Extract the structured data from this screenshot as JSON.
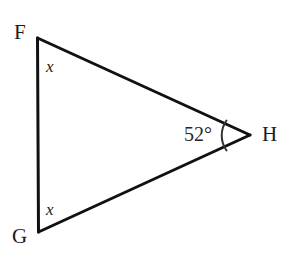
{
  "figure": {
    "kind": "geometry-diagram",
    "shape": "triangle",
    "background_color": "#ffffff",
    "stroke_color": "#111111",
    "text_color": "#1a1a1a",
    "stroke_width": 3,
    "arc_stroke_width": 2
  },
  "vertices": {
    "F": {
      "label": "F",
      "x": 37,
      "y": 38
    },
    "G": {
      "label": "G",
      "x": 38,
      "y": 232
    },
    "H": {
      "label": "H",
      "x": 250,
      "y": 135
    }
  },
  "edges": [
    {
      "name": "FG",
      "from": "F",
      "to": "G"
    },
    {
      "name": "FH",
      "from": "F",
      "to": "H"
    },
    {
      "name": "GH",
      "from": "G",
      "to": "H"
    }
  ],
  "angles": {
    "at_F": {
      "label": "x",
      "vertex": "F",
      "unit": ""
    },
    "at_G": {
      "label": "x",
      "vertex": "G",
      "unit": ""
    },
    "at_H": {
      "label": "52°",
      "value": 52,
      "unit": "degrees",
      "vertex": "H",
      "has_arc_marker": true
    }
  },
  "arc_marker": {
    "name": "angle-arc-H",
    "center_x": 250,
    "center_y": 135,
    "radius": 26,
    "start_x": 226,
    "start_y": 121,
    "end_x": 226,
    "end_y": 150
  }
}
